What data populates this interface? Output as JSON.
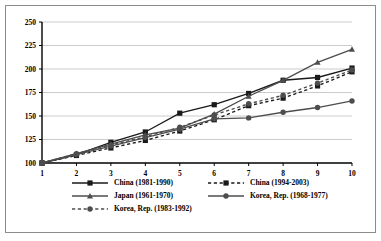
{
  "chart_data": {
    "type": "line",
    "title": "",
    "xlabel": "",
    "ylabel": "",
    "xlim": [
      1,
      10
    ],
    "ylim": [
      100,
      250
    ],
    "ytick_step": 25,
    "grid": "horizontal",
    "legend_position": "bottom",
    "x": [
      1,
      2,
      3,
      4,
      5,
      6,
      7,
      8,
      9,
      10
    ],
    "xticklabels": [
      "1",
      "2",
      "3",
      "4",
      "5",
      "6",
      "7",
      "8",
      "9",
      "10"
    ],
    "yticklabels": [
      "100",
      "125",
      "150",
      "175",
      "200",
      "225",
      "250"
    ],
    "yticks": [
      100,
      125,
      150,
      175,
      200,
      225,
      250
    ],
    "series": [
      {
        "name": "China (1981-1990)",
        "marker": "square",
        "linestyle": "solid",
        "color": "#1a1a1a",
        "values": [
          100,
          109,
          122,
          133,
          153,
          162,
          174,
          188,
          191,
          201
        ]
      },
      {
        "name": "China (1994-2003)",
        "marker": "square",
        "linestyle": "dashed",
        "color": "#1a1a1a",
        "values": [
          100,
          108,
          116,
          124,
          134,
          146,
          161,
          169,
          182,
          197
        ]
      },
      {
        "name": "Japan (1961-1970)",
        "marker": "triangle",
        "linestyle": "solid",
        "color": "#4d4d4d",
        "values": [
          100,
          110,
          120,
          130,
          137,
          152,
          171,
          188,
          207,
          221
        ]
      },
      {
        "name": "Korea, Rep. (1968-1977)",
        "marker": "circle",
        "linestyle": "solid",
        "color": "#4d4d4d",
        "values": [
          100,
          109,
          118,
          127,
          136,
          147,
          148,
          154,
          159,
          166
        ]
      },
      {
        "name": "Korea, Rep. (1983-1992)",
        "marker": "circle",
        "linestyle": "dashed",
        "color": "#4d4d4d",
        "values": [
          100,
          110,
          119,
          128,
          138,
          151,
          163,
          172,
          185,
          199
        ]
      }
    ],
    "legend": [
      {
        "label": "China (1981-1990)",
        "marker": "square",
        "linestyle": "solid",
        "color": "#1a1a1a"
      },
      {
        "label": "China (1994-2003)",
        "marker": "square",
        "linestyle": "dashed",
        "color": "#1a1a1a"
      },
      {
        "label": "Japan (1961-1970)",
        "marker": "triangle",
        "linestyle": "solid",
        "color": "#4d4d4d"
      },
      {
        "label": "Korea, Rep. (1968-1977)",
        "marker": "circle",
        "linestyle": "solid",
        "color": "#4d4d4d"
      },
      {
        "label": "Korea, Rep. (1983-1992)",
        "marker": "circle",
        "linestyle": "dashed",
        "color": "#4d4d4d"
      }
    ]
  },
  "style": {
    "frame_color": "#8c8c8c",
    "axis_color": "#000000",
    "grid_color": "#b5b5b5",
    "background": "#ffffff"
  }
}
